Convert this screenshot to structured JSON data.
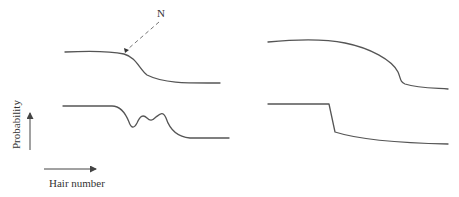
{
  "diagram": {
    "annotation_label": "N",
    "y_axis_label": "Probability",
    "x_axis_label": "Hair number",
    "panels": [
      {
        "id": "top-left",
        "description": "smooth plateau with gentle drop at point N"
      },
      {
        "id": "top-right",
        "description": "long convex plateau then sharp drop"
      },
      {
        "id": "bottom-left",
        "description": "plateau, oscillating dip with two peaks, then low plateau"
      },
      {
        "id": "bottom-right",
        "description": "flat plateau, abrupt step drop, slow decline"
      }
    ],
    "colors": {
      "line": "#555555",
      "text": "#333333",
      "background": "#ffffff"
    }
  }
}
